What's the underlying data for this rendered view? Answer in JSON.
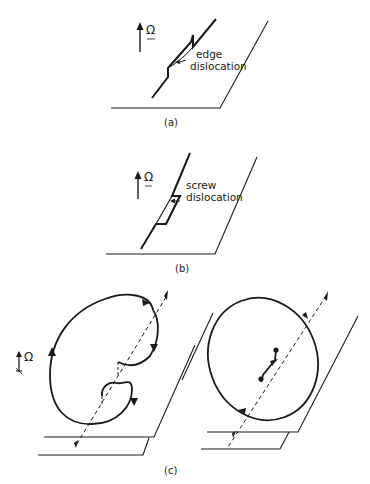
{
  "figure": {
    "panels": [
      {
        "id": "a",
        "caption": "(a)",
        "label_line1": "edge",
        "label_line2": "dislocation",
        "vector_symbol": "Ω"
      },
      {
        "id": "b",
        "caption": "(b)",
        "label_line1": "screw",
        "label_line2": "dislocation",
        "vector_symbol": "Ω"
      },
      {
        "id": "c",
        "caption": "(c)",
        "vector_symbol": "Ω"
      }
    ],
    "colors": {
      "ink": "#1a1a1a",
      "background": "#ffffff"
    }
  }
}
